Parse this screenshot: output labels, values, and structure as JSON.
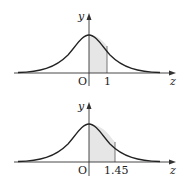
{
  "diagrams": [
    {
      "id": "top",
      "y_label": "y",
      "x_label": "z",
      "origin_label": "O",
      "tick_label": "1",
      "tick_value": 1,
      "shaded_region": "0 to 1"
    },
    {
      "id": "bottom",
      "y_label": "y",
      "x_label": "z",
      "origin_label": "O",
      "tick_label": "1.45",
      "tick_value": 1.45,
      "shaded_region": "0 to 1.45"
    }
  ],
  "colors": {
    "curve": "#222222",
    "axis": "#333333",
    "shade": "#e6e6e6"
  }
}
